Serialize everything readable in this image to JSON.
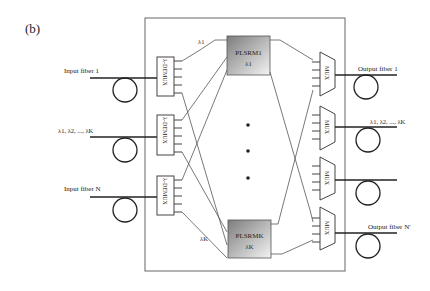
{
  "figure_label": "(b)",
  "inputs": [
    {
      "label": "Input fiber 1"
    },
    {
      "label": "λ1, λ2, ..., λK"
    },
    {
      "label": "Input fiber N"
    }
  ],
  "outputs": [
    {
      "label": "Output fiber 1"
    },
    {
      "label": "λ1, λ2, ..., λK"
    },
    {
      "label": ""
    },
    {
      "label": "Output fiber N'"
    }
  ],
  "demux_label": "λ-DEMUX",
  "mux_label": "MUX",
  "plsrm_blocks": [
    {
      "name": "PLSRM1",
      "wavelength": "λ1"
    },
    {
      "name": "PLSRMK",
      "wavelength": "λK"
    }
  ],
  "wavelength_tags": {
    "top": "λ1",
    "bottom": "λK"
  },
  "ellipsis": "• • •",
  "colors": {
    "line": "#333333",
    "box_border": "#555555",
    "plsrm_dark": "#8a8a8a",
    "plsrm_light": "#f2f2f2"
  }
}
